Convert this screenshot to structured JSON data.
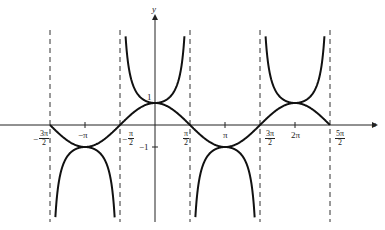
{
  "chart_data": {
    "type": "line",
    "title": "",
    "xlabel": "x",
    "ylabel": "y",
    "series": [
      {
        "name": "y = cos x",
        "function": "cos(x)",
        "domain": [
          -4.712,
          7.854
        ]
      },
      {
        "name": "y = sec x",
        "function": "1/cos(x)",
        "domain": [
          -4.712,
          7.854
        ]
      }
    ],
    "vertical_asymptotes": [
      "-3π/2",
      "-π/2",
      "π/2",
      "3π/2",
      "5π/2"
    ],
    "x_tick_labels": [
      "-3π/2",
      "-π",
      "-π/2",
      "π/2",
      "π",
      "3π/2",
      "2π",
      "5π/2"
    ],
    "y_tick_labels": [
      "1",
      "-1"
    ],
    "xlim": [
      -5.0,
      8.3
    ],
    "ylim": [
      -4.6,
      5.3
    ],
    "grid": false,
    "legend": "none"
  },
  "labels": {
    "y_axis": "y",
    "x_axis": "x",
    "one": "1",
    "neg_one": "−1",
    "neg_pi": "−π",
    "pi": "π",
    "two_pi": "2π",
    "frac_neg3pi2": {
      "sign": "−",
      "num": "3π",
      "den": "2"
    },
    "frac_negpi2": {
      "sign": "−",
      "num": "π",
      "den": "2"
    },
    "frac_pi2": {
      "num": "π",
      "den": "2"
    },
    "frac_3pi2": {
      "num": "3π",
      "den": "2"
    },
    "frac_5pi2": {
      "num": "5π",
      "den": "2"
    }
  }
}
